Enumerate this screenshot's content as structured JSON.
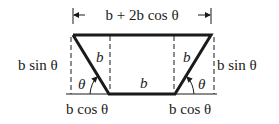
{
  "diagram": {
    "type": "trapezoid-cross-section",
    "labels": {
      "top_width": "b + 2b cos θ",
      "left_height": "b sin θ",
      "right_height": "b sin θ",
      "left_side": "b",
      "right_side": "b",
      "bottom": "b",
      "left_angle": "θ",
      "right_angle": "θ",
      "left_base_proj": "b cos θ",
      "right_base_proj": "b cos θ"
    },
    "colors": {
      "stroke": "#1a1a1a",
      "background": "#ffffff"
    }
  }
}
